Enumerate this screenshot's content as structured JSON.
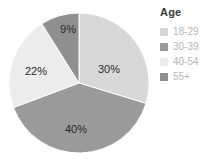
{
  "chart_data": {
    "type": "pie",
    "title": "",
    "legend_title": "Age",
    "legend_position": "right",
    "categories": [
      "18-29",
      "30-39",
      "40-54",
      "55+"
    ],
    "values": [
      30,
      40,
      22,
      9
    ],
    "value_labels": [
      "30%",
      "40%",
      "22%",
      "9%"
    ],
    "colors": [
      "#d8d8d8",
      "#9a9a9a",
      "#ececec",
      "#8f8f8f"
    ],
    "start_angle_deg": 0,
    "direction": "clockwise",
    "units": "percent",
    "slices": [
      {
        "label": "18-29",
        "value": 30,
        "display": "30%",
        "color": "#d8d8d8"
      },
      {
        "label": "30-39",
        "value": 40,
        "display": "40%",
        "color": "#9a9a9a"
      },
      {
        "label": "40-54",
        "value": 22,
        "display": "22%",
        "color": "#ececec"
      },
      {
        "label": "55+",
        "value": 9,
        "display": "9%",
        "color": "#8f8f8f"
      }
    ]
  },
  "legend": {
    "title": "Age",
    "items": [
      {
        "label": "18-29",
        "color": "#d8d8d8"
      },
      {
        "label": "30-39",
        "color": "#9a9a9a"
      },
      {
        "label": "40-54",
        "color": "#ececec"
      },
      {
        "label": "55+",
        "color": "#8f8f8f"
      }
    ]
  },
  "pie_labels": {
    "s0": "30%",
    "s1": "40%",
    "s2": "22%",
    "s3": "9%"
  }
}
